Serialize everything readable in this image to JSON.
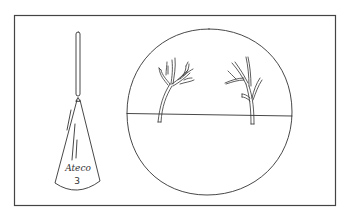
{
  "illustration": {
    "description": "Line drawing of a piping tip and a piped branch decoration",
    "frame": {
      "stroke_color": "#444444"
    },
    "piping_tip": {
      "brand_label": "Ateco",
      "size_number": "3"
    },
    "plate": {
      "branches": [
        {
          "name": "left-branch"
        },
        {
          "name": "right-branch"
        }
      ]
    },
    "colors": {
      "ink": "#333333",
      "background": "#ffffff"
    }
  }
}
